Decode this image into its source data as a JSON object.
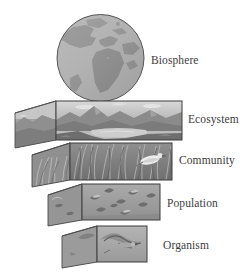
{
  "diagram": {
    "background_color": "#ffffff",
    "label_color": "#3c3c3c",
    "levels": [
      {
        "id": "biosphere",
        "label": "Biosphere",
        "shape": "sphere",
        "scene": "globe showing Earth with Africa, Europe and North America landmasses",
        "land_color": "#8d8d8d",
        "ocean_color": "#b5b5b5"
      },
      {
        "id": "ecosystem",
        "label": "Ecosystem",
        "shape": "box",
        "scene": "lake with mountains, shoreline and sky with clouds",
        "front_color": "#b9b9b9",
        "side_color": "#a2a2a2"
      },
      {
        "id": "community",
        "label": "Community",
        "shape": "box",
        "scene": "tall marsh grasses and reeds with a perching bird",
        "front_color": "#9a9a9a",
        "side_color": "#8a8a8a"
      },
      {
        "id": "population",
        "label": "Population",
        "shape": "box",
        "scene": "flock of several birds in flight",
        "front_color": "#9e9e9e",
        "side_color": "#8b8b8b"
      },
      {
        "id": "organism",
        "label": "Organism",
        "shape": "box",
        "scene": "single bird in flight",
        "front_color": "#a8a8a8",
        "side_color": "#929292"
      }
    ]
  }
}
